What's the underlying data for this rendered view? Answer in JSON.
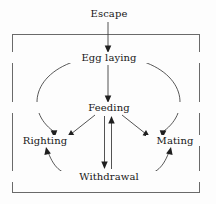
{
  "figure": {
    "type": "state-transition-diagram",
    "background_color": "#fdfdfd",
    "box": {
      "label": "organism-boundary-box",
      "stroke_color": "#6a6a6a",
      "x": 12,
      "y": 34,
      "width": 188,
      "height": 159
    },
    "external_nodes": [
      {
        "id": "escape",
        "label": "Escape",
        "x": 108,
        "y": 14
      }
    ],
    "internal_nodes": [
      {
        "id": "egg_laying",
        "label": "Egg laying",
        "x": 108,
        "y": 58
      },
      {
        "id": "feeding",
        "label": "Feeding",
        "x": 108,
        "y": 108
      },
      {
        "id": "righting",
        "label": "Righting",
        "x": 44,
        "y": 141
      },
      {
        "id": "mating",
        "label": "Mating",
        "x": 172,
        "y": 141
      },
      {
        "id": "withdrawal",
        "label": "Withdrawal",
        "x": 108,
        "y": 177
      }
    ],
    "edges": [
      {
        "from": "escape",
        "to": "egg_laying",
        "style": "straight",
        "direction": "one-way"
      },
      {
        "from": "egg_laying",
        "to": "feeding",
        "style": "straight",
        "direction": "one-way"
      },
      {
        "from": "feeding",
        "to": "righting",
        "style": "straight",
        "direction": "one-way"
      },
      {
        "from": "feeding",
        "to": "mating",
        "style": "straight",
        "direction": "one-way"
      },
      {
        "from": "feeding",
        "to": "withdrawal",
        "style": "straight",
        "direction": "one-way"
      },
      {
        "from": "withdrawal",
        "to": "feeding",
        "style": "straight",
        "direction": "one-way"
      },
      {
        "from": "righting",
        "to": "egg_laying",
        "style": "arc-left",
        "direction": "two-way"
      },
      {
        "from": "mating",
        "to": "egg_laying",
        "style": "arc-right",
        "direction": "two-way"
      },
      {
        "from": "righting",
        "to": "withdrawal",
        "style": "arc-bottom-left",
        "direction": "two-way"
      },
      {
        "from": "withdrawal",
        "to": "mating",
        "style": "arc-bottom-right",
        "direction": "two-way"
      }
    ],
    "edge_color": "#3a3a3a",
    "arrowhead_color": "#1f1f1f",
    "text_color": "#171717"
  }
}
